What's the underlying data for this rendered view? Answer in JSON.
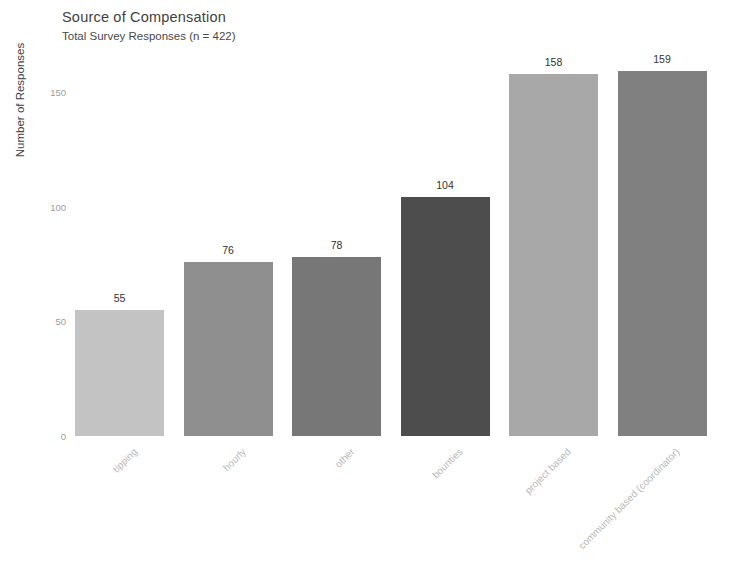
{
  "chart_data": {
    "type": "bar",
    "title": "Source of Compensation",
    "subtitle": "Total Survey Responses (n = 422)",
    "xlabel": "",
    "ylabel": "Number of Responses",
    "categories": [
      "tipping",
      "hourly",
      "other",
      "bounties",
      "project based",
      "community based (coordinator)"
    ],
    "values": [
      55,
      76,
      78,
      104,
      158,
      159
    ],
    "bar_colors": [
      "#c3c3c3",
      "#8f8f8f",
      "#777777",
      "#4d4d4d",
      "#a8a8a8",
      "#808080"
    ],
    "ylim": [
      0,
      170
    ],
    "yticks": [
      0,
      50,
      100,
      150
    ],
    "ytick_labels": [
      "0",
      "50",
      "100",
      "150"
    ],
    "grid": false,
    "legend": false,
    "background": "#ffffff",
    "xtick_rotation_deg": -45
  }
}
